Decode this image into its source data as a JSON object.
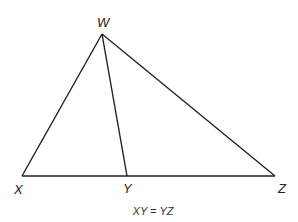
{
  "diagram": {
    "type": "triangle",
    "points": {
      "W": {
        "label": "W",
        "x": 102,
        "y": 34
      },
      "X": {
        "label": "X",
        "x": 22,
        "y": 176
      },
      "Y": {
        "label": "Y",
        "x": 127,
        "y": 176
      },
      "Z": {
        "label": "Z",
        "x": 275,
        "y": 176
      }
    },
    "segments": [
      "WX",
      "WZ",
      "XZ",
      "WY"
    ],
    "caption": "XY = YZ",
    "stroke_color": "#222222"
  }
}
